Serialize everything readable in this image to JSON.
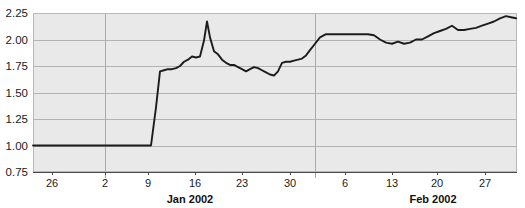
{
  "chart_data": {
    "type": "line",
    "title": "",
    "xlabel": "",
    "ylabel": "",
    "ylim": [
      0.75,
      2.25
    ],
    "grid": true,
    "legend": null,
    "y_ticks": [
      "0.75",
      "1.00",
      "1.25",
      "1.50",
      "1.75",
      "2.00",
      "2.25"
    ],
    "y_tick_values": [
      0.75,
      1.0,
      1.25,
      1.5,
      1.75,
      2.0,
      2.25
    ],
    "x_ticks": [
      "26",
      "2",
      "9",
      "16",
      "23",
      "30",
      "6",
      "13",
      "20",
      "27"
    ],
    "x_tick_positions": [
      52,
      105,
      148,
      195,
      242,
      290,
      345,
      392,
      437,
      485
    ],
    "month_labels": [
      {
        "text": "Jan 2002",
        "x": 190
      },
      {
        "text": "Feb 2002",
        "x": 433
      }
    ],
    "month_divider_x": [
      105,
      315
    ],
    "series": [
      {
        "name": "value",
        "color": "#1c1c1c",
        "x": [
          33,
          40,
          47,
          54,
          61,
          68,
          75,
          82,
          89,
          96,
          103,
          110,
          117,
          124,
          131,
          138,
          145,
          151,
          156,
          160,
          164,
          168,
          172,
          176,
          180,
          184,
          188,
          192,
          196,
          200,
          204,
          207,
          210,
          214,
          218,
          222,
          226,
          230,
          234,
          238,
          242,
          246,
          250,
          254,
          258,
          262,
          266,
          270,
          274,
          278,
          282,
          286,
          290,
          294,
          298,
          302,
          306,
          310,
          315,
          320,
          326,
          332,
          338,
          344,
          350,
          356,
          362,
          368,
          374,
          380,
          386,
          392,
          398,
          404,
          410,
          416,
          422,
          428,
          434,
          440,
          446,
          452,
          458,
          464,
          470,
          476,
          482,
          488,
          494,
          500,
          506,
          511,
          516
        ],
        "y": [
          1.0,
          1.0,
          1.0,
          1.0,
          1.0,
          1.0,
          1.0,
          1.0,
          1.0,
          1.0,
          1.0,
          1.0,
          1.0,
          1.0,
          1.0,
          1.0,
          1.0,
          1.0,
          1.36,
          1.7,
          1.71,
          1.72,
          1.72,
          1.73,
          1.75,
          1.79,
          1.81,
          1.84,
          1.83,
          1.84,
          1.99,
          2.17,
          2.02,
          1.89,
          1.86,
          1.81,
          1.78,
          1.76,
          1.76,
          1.74,
          1.72,
          1.7,
          1.72,
          1.74,
          1.73,
          1.71,
          1.69,
          1.67,
          1.66,
          1.7,
          1.78,
          1.79,
          1.79,
          1.8,
          1.81,
          1.82,
          1.85,
          1.9,
          1.96,
          2.02,
          2.05,
          2.05,
          2.05,
          2.05,
          2.05,
          2.05,
          2.05,
          2.05,
          2.04,
          2.0,
          1.97,
          1.96,
          1.98,
          1.96,
          1.97,
          2.0,
          2.0,
          2.03,
          2.06,
          2.08,
          2.1,
          2.13,
          2.09,
          2.09,
          2.1,
          2.11,
          2.13,
          2.15,
          2.17,
          2.2,
          2.22,
          2.21,
          2.2
        ]
      }
    ]
  },
  "layout": {
    "plot_left": 33,
    "plot_right": 517,
    "plot_top": 13,
    "plot_bottom": 172
  }
}
